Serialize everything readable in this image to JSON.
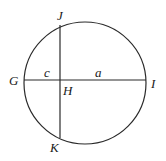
{
  "diagram": {
    "type": "circle-with-intersecting-chords",
    "circle": {
      "cx": 85,
      "cy": 83,
      "r": 61
    },
    "chords": [
      {
        "name": "GI",
        "from": "G",
        "to": "I",
        "x1": 24,
        "y1": 80,
        "x2": 146,
        "y2": 80
      },
      {
        "name": "JK",
        "from": "J",
        "to": "K",
        "x1": 60,
        "y1": 25,
        "x2": 60,
        "y2": 138
      }
    ],
    "intersection": "H",
    "segments": [
      {
        "label": "c",
        "between": [
          "G",
          "H"
        ]
      },
      {
        "label": "a",
        "between": [
          "H",
          "I"
        ]
      }
    ]
  },
  "labels": {
    "J": "J",
    "G": "G",
    "H": "H",
    "I": "I",
    "K": "K",
    "c": "c",
    "a": "a"
  }
}
